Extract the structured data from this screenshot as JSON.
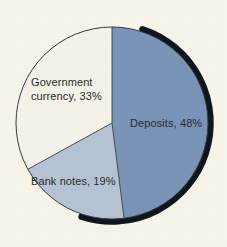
{
  "background_color": "#f7f4ea",
  "text_color": "#2b2b2b",
  "chart_data": {
    "type": "pie",
    "title": "",
    "subtitle": "",
    "xlabel": "",
    "ylabel": "",
    "legend_position": "none",
    "grid": false,
    "unit": "%",
    "start_angle_deg": 0,
    "direction": "clockwise",
    "center": {
      "x": 112,
      "y": 123
    },
    "radius": 96,
    "categories": [
      "Deposits",
      "Bank notes",
      "Government currency"
    ],
    "values": [
      48,
      19,
      33
    ],
    "labels": [
      "Deposits, 48%",
      "Bank notes, 19%",
      "Government currency, 33%"
    ],
    "colors": [
      "#7a94b8",
      "#b6c3d4",
      "#f5f2e9"
    ],
    "outline_color": "#3a3a3a",
    "shadow_color": "#0d1520",
    "slices": [
      {
        "name": "Deposits",
        "value": 48,
        "label": "Deposits, 48%",
        "color": "#7a94b8",
        "start_deg": 0,
        "sweep_deg": 172.8,
        "label_x": 130,
        "label_y": 127
      },
      {
        "name": "Bank notes",
        "value": 19,
        "label": "Bank notes, 19%",
        "color": "#b6c3d4",
        "start_deg": 172.8,
        "sweep_deg": 68.4,
        "label_x": 31,
        "label_y": 185
      },
      {
        "name": "Government currency",
        "value": 33,
        "label_line1": "Government",
        "label_line2": "currency, 33%",
        "label": "Government currency, 33%",
        "color": "#f5f2e9",
        "start_deg": 241.2,
        "sweep_deg": 118.8,
        "label_x": 31,
        "label_y": 86
      }
    ]
  }
}
